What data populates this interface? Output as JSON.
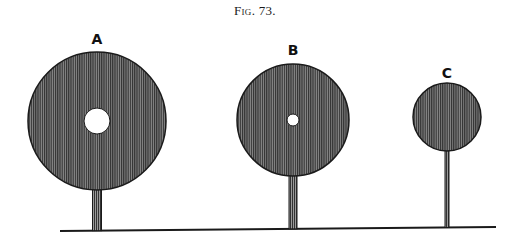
{
  "figure": {
    "title": "Fig. 73."
  },
  "discs": [
    {
      "label": "A",
      "cx": 97,
      "cy": 121,
      "r": 69,
      "hole_r": 13,
      "stem_x": 97,
      "stem_w": 9,
      "label_y": 44
    },
    {
      "label": "B",
      "cx": 293,
      "cy": 120,
      "r": 56,
      "hole_r": 6,
      "stem_x": 293,
      "stem_w": 8,
      "label_y": 55
    },
    {
      "label": "C",
      "cx": 447,
      "cy": 117,
      "r": 34,
      "hole_r": 0,
      "stem_x": 447,
      "stem_w": 4,
      "label_y": 78
    }
  ],
  "ground": {
    "x1": 60,
    "y1": 231,
    "x2": 496,
    "y2": 227
  },
  "colors": {
    "ink": "#1a1a1a",
    "fill": "#555555",
    "paper": "#ffffff"
  }
}
